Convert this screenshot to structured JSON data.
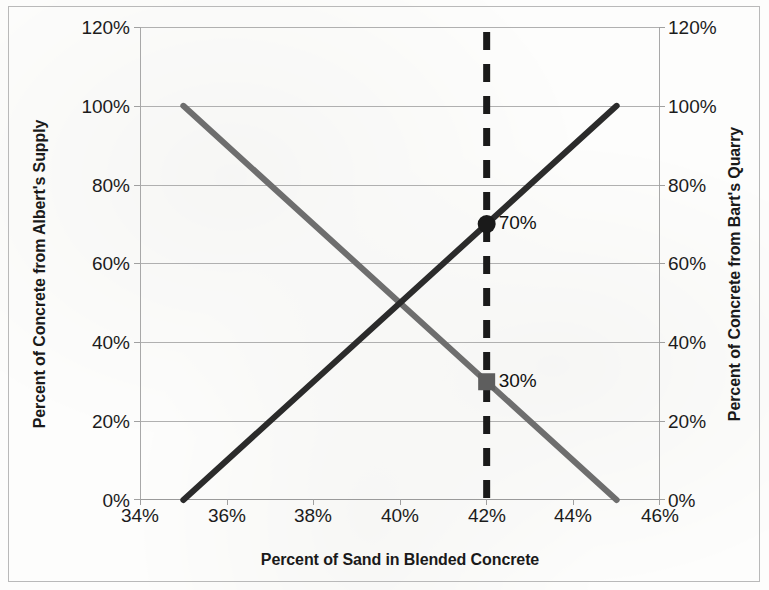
{
  "chart_data": {
    "type": "line",
    "title": "",
    "xlabel": "Percent of Sand in Blended Concrete",
    "ylabel": "Percent of Concrete from Albert's Supply",
    "y2label": "Percent of Concrete from  Bart's Quarry",
    "xlim": [
      34,
      46
    ],
    "ylim": [
      0,
      120
    ],
    "y2lim": [
      0,
      120
    ],
    "xticks": [
      "34%",
      "36%",
      "38%",
      "40%",
      "42%",
      "44%",
      "46%"
    ],
    "xtick_values": [
      34,
      36,
      38,
      40,
      42,
      44,
      46
    ],
    "yticks": [
      "0%",
      "20%",
      "40%",
      "60%",
      "80%",
      "100%",
      "120%"
    ],
    "ytick_values": [
      0,
      20,
      40,
      60,
      80,
      100,
      120
    ],
    "y2ticks": [
      "0%",
      "20%",
      "40%",
      "60%",
      "80%",
      "100%",
      "120%"
    ],
    "y2tick_values": [
      0,
      20,
      40,
      60,
      80,
      100,
      120
    ],
    "grid": "horizontal",
    "legend": "none",
    "series": [
      {
        "name": "Albert's Supply",
        "color": "#2b2b2b",
        "style": "solid",
        "width": 6,
        "axis": "left",
        "x": [
          35,
          45
        ],
        "values": [
          0,
          100
        ]
      },
      {
        "name": "Bart's Quarry",
        "color": "#6e6e6e",
        "style": "solid",
        "width": 6,
        "axis": "right",
        "x": [
          35,
          45
        ],
        "values": [
          100,
          0
        ]
      }
    ],
    "annotations": [
      {
        "name": "reference-line",
        "type": "vertical-dashed-line",
        "x": 42,
        "color": "#1a1a1a",
        "label": ""
      },
      {
        "name": "albert-point",
        "type": "marker",
        "marker": "circle",
        "x": 42,
        "y": 70,
        "label": "70%",
        "color": "#1a1a1a"
      },
      {
        "name": "bart-point",
        "type": "marker",
        "marker": "square",
        "x": 42,
        "y": 30,
        "label": "30%",
        "color": "#5e5e5e"
      }
    ]
  },
  "axes": {
    "y_left_title": "Percent of Concrete from Albert's Supply",
    "y_right_title": "Percent of Concrete from  Bart's Quarry",
    "x_title": "Percent of Sand in Blended Concrete",
    "y_ticks": [
      "120%",
      "100%",
      "80%",
      "60%",
      "40%",
      "20%",
      "0%"
    ],
    "y2_ticks": [
      "120%",
      "100%",
      "80%",
      "60%",
      "40%",
      "20%",
      "0%"
    ],
    "x_ticks": [
      "34%",
      "36%",
      "38%",
      "40%",
      "42%",
      "44%",
      "46%"
    ]
  },
  "labels": {
    "albert_value": "70%",
    "bart_value": "30%"
  },
  "colors": {
    "albert_line": "#2b2b2b",
    "bart_line": "#6e6e6e",
    "gridline": "#b0b0b0",
    "dashed_reference": "#1a1a1a",
    "background": "#fdfdfc"
  }
}
